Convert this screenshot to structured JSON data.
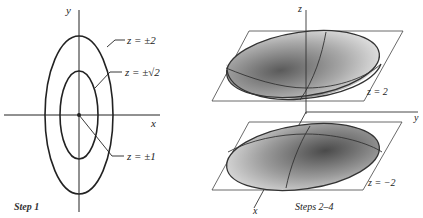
{
  "left_figure": {
    "axes": {
      "x_label": "x",
      "y_label": "y"
    },
    "level_curves": [
      {
        "label": "z = ±2",
        "description": "outer ellipse"
      },
      {
        "label": "z = ±√2",
        "description": "inner ellipse"
      },
      {
        "label": "z = ±1",
        "description": "origin point"
      }
    ],
    "caption": "Step 1"
  },
  "right_figure": {
    "axes": {
      "x_label": "x",
      "y_label": "y",
      "z_label": "z"
    },
    "planes": [
      {
        "label": "z = 2",
        "position": "upper"
      },
      {
        "label": "z = −2",
        "position": "lower"
      }
    ],
    "caption": "Steps 2–4"
  }
}
